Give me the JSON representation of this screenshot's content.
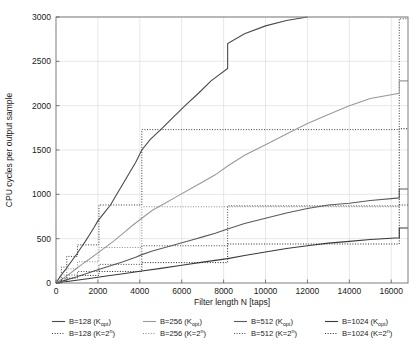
{
  "chart_data": {
    "type": "line",
    "title": "",
    "xlabel": "Filter length N [taps]",
    "ylabel": "CPU cycles per output sample",
    "xlim": [
      0,
      16800
    ],
    "ylim": [
      0,
      3000
    ],
    "xticks": [
      0,
      2000,
      4000,
      6000,
      8000,
      10000,
      12000,
      14000,
      16000
    ],
    "xticklabels": [
      "0",
      "2000",
      "4000",
      "6000",
      "8000",
      "10000",
      "12000",
      "14000",
      "16000"
    ],
    "yticks": [
      0,
      500,
      1000,
      1500,
      2000,
      2500,
      3000
    ],
    "yticklabels": [
      "0",
      "500",
      "1000",
      "1500",
      "2000",
      "2500",
      "3000"
    ],
    "grid": true,
    "legend_position": "below",
    "series": [
      {
        "name": "B=128 (K_opt)",
        "label_base": "B=128 (K",
        "label_sub": "opt",
        "label_tail": ")",
        "style": "solid",
        "color": "#4a4a4a",
        "width": 1.1,
        "points": [
          [
            0,
            0
          ],
          [
            150,
            55
          ],
          [
            300,
            105
          ],
          [
            450,
            150
          ],
          [
            600,
            200
          ],
          [
            800,
            265
          ],
          [
            1000,
            330
          ],
          [
            1200,
            400
          ],
          [
            1400,
            470
          ],
          [
            1600,
            545
          ],
          [
            1800,
            620
          ],
          [
            2000,
            700
          ],
          [
            2300,
            790
          ],
          [
            2600,
            880
          ],
          [
            2900,
            1000
          ],
          [
            3200,
            1120
          ],
          [
            3500,
            1240
          ],
          [
            3800,
            1360
          ],
          [
            4096,
            1500
          ],
          [
            4500,
            1620
          ],
          [
            5000,
            1730
          ],
          [
            5600,
            1870
          ],
          [
            6200,
            2010
          ],
          [
            6800,
            2140
          ],
          [
            7400,
            2280
          ],
          [
            8192,
            2420
          ],
          [
            8192,
            2700
          ],
          [
            9000,
            2810
          ],
          [
            10000,
            2900
          ],
          [
            11000,
            2960
          ],
          [
            12000,
            3000
          ]
        ]
      },
      {
        "name": "B=128 (K=2^n)",
        "label_base": "B=128 (K=2",
        "label_sup": "n",
        "label_tail": ")",
        "style": "dotted",
        "color": "#3a3a3a",
        "width": 1.0,
        "steps": [
          [
            0,
            0
          ],
          [
            256,
            180
          ],
          [
            512,
            300
          ],
          [
            1024,
            430
          ],
          [
            2048,
            880
          ],
          [
            4096,
            1730
          ],
          [
            16384,
            1730
          ],
          [
            16384,
            2980
          ],
          [
            16800,
            2980
          ]
        ]
      },
      {
        "name": "B=256 (K_opt)",
        "label_base": "B=256 (K",
        "label_sub": "opt",
        "label_tail": ")",
        "style": "solid",
        "color": "#9a9a9a",
        "width": 1.1,
        "points": [
          [
            0,
            0
          ],
          [
            300,
            45
          ],
          [
            600,
            95
          ],
          [
            900,
            150
          ],
          [
            1200,
            205
          ],
          [
            1600,
            270
          ],
          [
            2000,
            340
          ],
          [
            2400,
            410
          ],
          [
            2800,
            480
          ],
          [
            3200,
            560
          ],
          [
            3600,
            640
          ],
          [
            4096,
            730
          ],
          [
            4600,
            820
          ],
          [
            5200,
            900
          ],
          [
            5800,
            980
          ],
          [
            6400,
            1060
          ],
          [
            7000,
            1140
          ],
          [
            7600,
            1220
          ],
          [
            8192,
            1320
          ],
          [
            9000,
            1440
          ],
          [
            10000,
            1560
          ],
          [
            11000,
            1680
          ],
          [
            12000,
            1800
          ],
          [
            13000,
            1900
          ],
          [
            14000,
            2000
          ],
          [
            15000,
            2080
          ],
          [
            16384,
            2140
          ],
          [
            16384,
            2280
          ],
          [
            16800,
            2280
          ]
        ]
      },
      {
        "name": "B=256 (K=2^n)",
        "label_base": "B=256 (K=2",
        "label_sup": "n",
        "label_tail": ")",
        "style": "dotted",
        "color": "#8a8a8a",
        "width": 1.0,
        "steps": [
          [
            0,
            0
          ],
          [
            256,
            90
          ],
          [
            512,
            160
          ],
          [
            1024,
            240
          ],
          [
            2048,
            400
          ],
          [
            4096,
            860
          ],
          [
            8192,
            860
          ],
          [
            16384,
            860
          ],
          [
            16384,
            1740
          ],
          [
            16800,
            1740
          ]
        ]
      },
      {
        "name": "B=512 (K_opt)",
        "label_base": "B=512 (K",
        "label_sub": "opt",
        "label_tail": ")",
        "style": "solid",
        "color": "#5a5a5a",
        "width": 1.1,
        "points": [
          [
            0,
            0
          ],
          [
            500,
            35
          ],
          [
            1000,
            70
          ],
          [
            1500,
            110
          ],
          [
            2000,
            150
          ],
          [
            2600,
            195
          ],
          [
            3200,
            240
          ],
          [
            3800,
            290
          ],
          [
            4096,
            320
          ],
          [
            4600,
            360
          ],
          [
            5200,
            400
          ],
          [
            5800,
            440
          ],
          [
            6400,
            480
          ],
          [
            7000,
            520
          ],
          [
            7600,
            560
          ],
          [
            8192,
            610
          ],
          [
            9000,
            670
          ],
          [
            10000,
            730
          ],
          [
            11000,
            790
          ],
          [
            12000,
            840
          ],
          [
            13000,
            880
          ],
          [
            14000,
            900
          ],
          [
            15000,
            930
          ],
          [
            16384,
            960
          ],
          [
            16384,
            1060
          ],
          [
            16800,
            1060
          ]
        ]
      },
      {
        "name": "B=512 (K=2^n)",
        "label_base": "B=512 (K=2",
        "label_sup": "n",
        "label_tail": ")",
        "style": "dotted",
        "color": "#4a4a4a",
        "width": 1.0,
        "steps": [
          [
            0,
            0
          ],
          [
            256,
            50
          ],
          [
            512,
            90
          ],
          [
            1024,
            130
          ],
          [
            2048,
            210
          ],
          [
            4096,
            420
          ],
          [
            8192,
            870
          ],
          [
            16384,
            870
          ],
          [
            16384,
            1740
          ],
          [
            16800,
            1740
          ]
        ]
      },
      {
        "name": "B=1024 (K_opt)",
        "label_base": "B=1024 (K",
        "label_sub": "opt",
        "label_tail": ")",
        "style": "solid",
        "color": "#3a3a3a",
        "width": 1.1,
        "points": [
          [
            0,
            0
          ],
          [
            800,
            25
          ],
          [
            1600,
            50
          ],
          [
            2400,
            78
          ],
          [
            3200,
            105
          ],
          [
            4096,
            135
          ],
          [
            5000,
            165
          ],
          [
            6000,
            200
          ],
          [
            7000,
            235
          ],
          [
            8192,
            275
          ],
          [
            9000,
            310
          ],
          [
            10000,
            350
          ],
          [
            11000,
            390
          ],
          [
            12000,
            420
          ],
          [
            13000,
            450
          ],
          [
            14000,
            470
          ],
          [
            15000,
            490
          ],
          [
            16384,
            510
          ],
          [
            16384,
            620
          ],
          [
            16800,
            620
          ]
        ]
      },
      {
        "name": "B=1024 (K=2^n)",
        "label_base": "B=1024 (K=2",
        "label_sup": "n",
        "label_tail": ")",
        "style": "dotted",
        "color": "#2a2a2a",
        "width": 1.0,
        "steps": [
          [
            0,
            0
          ],
          [
            256,
            30
          ],
          [
            512,
            55
          ],
          [
            1024,
            85
          ],
          [
            2048,
            130
          ],
          [
            4096,
            230
          ],
          [
            8192,
            440
          ],
          [
            16384,
            440
          ],
          [
            16384,
            880
          ],
          [
            16800,
            880
          ]
        ]
      }
    ]
  },
  "legend": {
    "rows": [
      [
        "B=128 (K_opt)",
        "B=256 (K_opt)",
        "B=512 (K_opt)",
        "B=1024 (K_opt)"
      ],
      [
        "B=128 (K=2^n)",
        "B=256 (K=2^n)",
        "B=512 (K=2^n)",
        "B=1024 (K=2^n)"
      ]
    ]
  },
  "caption": ""
}
